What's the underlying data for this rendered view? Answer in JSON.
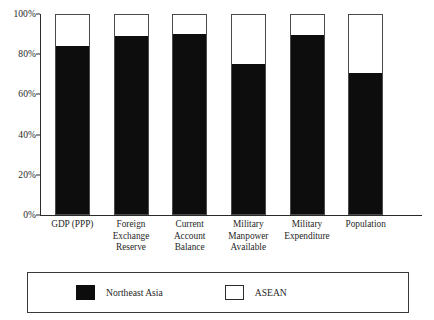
{
  "chart_data": {
    "type": "bar",
    "subtype": "stacked-100-percent",
    "title": "",
    "xlabel": "",
    "ylabel": "",
    "ylim": [
      0,
      100
    ],
    "ytick_labels": [
      "100%",
      "80%",
      "60%",
      "40%",
      "20%",
      "0%"
    ],
    "ytick_values": [
      100,
      80,
      60,
      40,
      20,
      0
    ],
    "grid": false,
    "legend_position": "bottom",
    "categories": [
      "GDP (PPP)",
      "Foreign\nExchange\nReserve",
      "Current\nAccount\nBalance",
      "Military\nManpower\nAvailable",
      "Military\nExpenditure",
      "Population"
    ],
    "series": [
      {
        "name": "Northeast Asia",
        "color": "#0d0d0d",
        "values": [
          84.5,
          89.5,
          90.5,
          75.5,
          90.0,
          71.0
        ]
      },
      {
        "name": "ASEAN",
        "color": "#ffffff",
        "values": [
          15.5,
          10.5,
          9.5,
          24.5,
          10.0,
          29.0
        ]
      }
    ]
  },
  "legend": {
    "entries": [
      {
        "label": "Northeast Asia",
        "swatch": "filled-square-icon"
      },
      {
        "label": "ASEAN",
        "swatch": "hollow-square-icon"
      }
    ]
  },
  "axes": {
    "y": {
      "ticks": [
        {
          "label": "100%",
          "value": 100
        },
        {
          "label": "80%",
          "value": 80
        },
        {
          "label": "60%",
          "value": 60
        },
        {
          "label": "40%",
          "value": 40
        },
        {
          "label": "20%",
          "value": 20
        },
        {
          "label": "0%",
          "value": 0
        }
      ]
    }
  }
}
